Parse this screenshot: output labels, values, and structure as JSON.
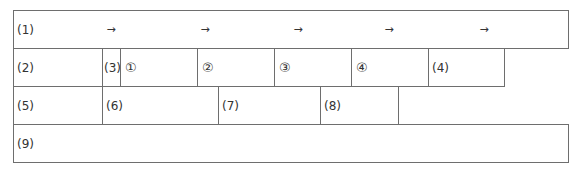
{
  "table": {
    "row1": {
      "label": "(1)",
      "arrows": [
        "→",
        "→",
        "→",
        "→",
        "→"
      ]
    },
    "row2": {
      "cells": [
        {
          "label": "(2)"
        },
        {
          "label": "(3)"
        },
        {
          "label": "①"
        },
        {
          "label": "②"
        },
        {
          "label": "③"
        },
        {
          "label": "④"
        },
        {
          "label": "(4)"
        }
      ]
    },
    "row3": {
      "cells": [
        {
          "label": "(5)"
        },
        {
          "label": "(6)"
        },
        {
          "label": "(7)"
        },
        {
          "label": "(8)"
        }
      ]
    },
    "row4": {
      "label": "(9)"
    }
  }
}
